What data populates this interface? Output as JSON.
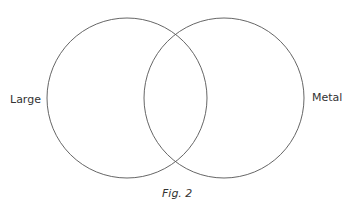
{
  "diagram": {
    "type": "venn",
    "sets": [
      {
        "label": "Large",
        "cx": 127,
        "cy": 98,
        "r": 80
      },
      {
        "label": "Metal",
        "cx": 224,
        "cy": 98,
        "r": 80
      }
    ],
    "stroke_color": "#555555",
    "caption": "Fig. 2"
  }
}
